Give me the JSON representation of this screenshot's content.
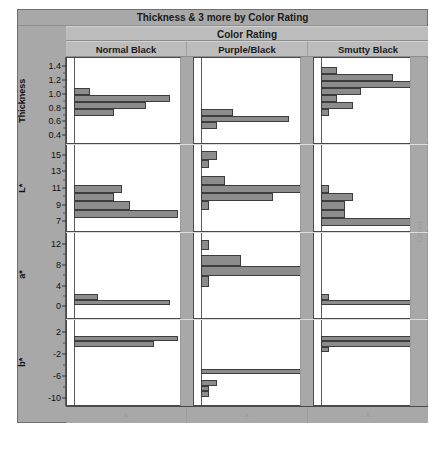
{
  "report": {
    "title": "Thickness & 3 more by Color Rating",
    "group_header": "Color Rating",
    "count_axis_label": "Count",
    "columns": [
      {
        "label": "Normal Black",
        "bottom_tick": "x"
      },
      {
        "label": "Purple/Black",
        "bottom_tick": "x"
      },
      {
        "label": "Smutty Black",
        "bottom_tick": "x"
      }
    ]
  },
  "chart_data": {
    "type": "bar",
    "title": "Thickness & 3 more by Color Rating",
    "subtitle": "Color Rating",
    "xlabel": "Count",
    "ylabel": "",
    "grid": false,
    "legend_position": "none",
    "orientation": "horizontal",
    "layout": "trellis 4 rows x 3 columns",
    "categories": [
      "Normal Black",
      "Purple/Black",
      "Smutty Black"
    ],
    "rows": [
      {
        "variable": "Thickness",
        "ylim": [
          0.3,
          1.5
        ],
        "ticks": [
          "1.4",
          "1.2",
          "1.0",
          "0.8",
          "0.6",
          "0.4"
        ],
        "tick_values": [
          1.4,
          1.2,
          1.0,
          0.8,
          0.6,
          0.4
        ],
        "panels": [
          {
            "group": "Normal Black",
            "bins": [
              1.05,
              0.95,
              0.85,
              0.75
            ],
            "counts": [
              2,
              12,
              9,
              5
            ]
          },
          {
            "group": "Purple/Black",
            "bins": [
              0.75,
              0.65,
              0.55
            ],
            "counts": [
              4,
              11,
              2
            ]
          },
          {
            "group": "Smutty Black",
            "bins": [
              1.35,
              1.25,
              1.15,
              1.05,
              0.95,
              0.85,
              0.75
            ],
            "counts": [
              2,
              9,
              13,
              5,
              2,
              4,
              1
            ]
          }
        ]
      },
      {
        "variable": "L*",
        "ylim": [
          6,
          16
        ],
        "ticks": [
          "15",
          "13",
          "11",
          "9",
          "7"
        ],
        "tick_values": [
          15,
          13,
          11,
          9,
          7
        ],
        "panels": [
          {
            "group": "Normal Black",
            "bins": [
              11,
              10,
              9,
              8
            ],
            "counts": [
              6,
              5,
              7,
              13
            ]
          },
          {
            "group": "Purple/Black",
            "bins": [
              15,
              14,
              12,
              11,
              10,
              9
            ],
            "counts": [
              2,
              1,
              3,
              13,
              9,
              1
            ]
          },
          {
            "group": "Smutty Black",
            "bins": [
              11,
              10,
              9,
              8,
              7
            ],
            "counts": [
              1,
              4,
              3,
              3,
              12
            ]
          }
        ]
      },
      {
        "variable": "a*",
        "ylim": [
          -2,
          14
        ],
        "ticks": [
          "12",
          "8",
          "4",
          "0"
        ],
        "tick_values": [
          12,
          8,
          4,
          0
        ],
        "panels": [
          {
            "group": "Normal Black",
            "bins": [
              2,
              1
            ],
            "counts": [
              3,
              12
            ]
          },
          {
            "group": "Purple/Black",
            "bins": [
              12,
              9,
              7,
              5
            ],
            "counts": [
              1,
              5,
              13,
              1
            ]
          },
          {
            "group": "Smutty Black",
            "bins": [
              2,
              1
            ],
            "counts": [
              1,
              13
            ]
          }
        ]
      },
      {
        "variable": "b*",
        "ylim": [
          -11,
          4
        ],
        "ticks": [
          "2",
          "-2",
          "-6",
          "-10"
        ],
        "tick_values": [
          2,
          -2,
          -6,
          -10
        ],
        "panels": [
          {
            "group": "Normal Black",
            "bins": [
              1,
              0
            ],
            "counts": [
              13,
              10
            ]
          },
          {
            "group": "Purple/Black",
            "bins": [
              -5,
              -7,
              -8,
              -9
            ],
            "counts": [
              13,
              2,
              1,
              1
            ]
          },
          {
            "group": "Smutty Black",
            "bins": [
              1,
              0,
              -1
            ],
            "counts": [
              12,
              14,
              1
            ]
          }
        ]
      }
    ]
  }
}
